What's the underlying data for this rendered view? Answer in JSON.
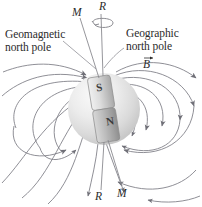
{
  "figure": {
    "background_color": "#ffffff",
    "labels": {
      "geomagnetic_north_pole": "Geomagnetic\nnorth pole",
      "geographic_north_pole": "Geographic\nnorth pole",
      "magnetic_axis_top": "M",
      "rotation_axis_top": "R",
      "rotation_axis_bottom": "R",
      "magnetic_axis_bottom": "M",
      "field_vector": "B",
      "magnet_south_pole": "S",
      "magnet_north_pole": "N"
    },
    "colors": {
      "field_line": "#7b7b83",
      "axis_line": "#8a8a90",
      "leader_line": "#8a8a90",
      "sphere_light": "#f2f2f2",
      "sphere_mid": "#dcdcdc",
      "sphere_dark": "#c6c6c6",
      "magnet_light": "#e8e8e8",
      "magnet_dark": "#9a9a9a",
      "text": "#2b2b2b"
    },
    "geometry": {
      "sphere_center_x": 104,
      "sphere_center_y": 109,
      "sphere_radius": 36,
      "magnet_tilt_degrees": -9,
      "rotation_axis_top_y": 14,
      "rotation_axis_bottom_y": 192
    },
    "elements": {
      "rotation_arrow": "curved-rotation-arrow",
      "field_line_count": 16,
      "arrowhead_direction": "north-pole-inward-south-pole-outward"
    }
  }
}
